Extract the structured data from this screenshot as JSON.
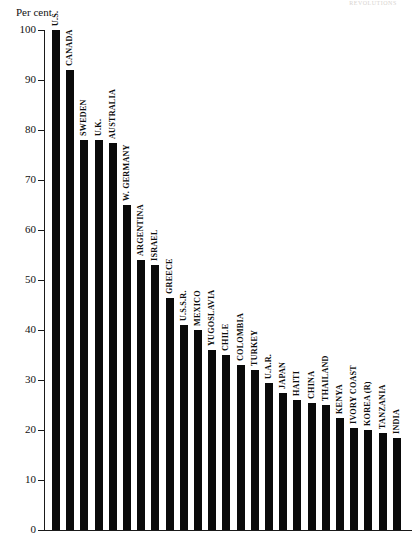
{
  "page": {
    "header_ghost": "REVOLUTIONS"
  },
  "chart_data": {
    "type": "bar",
    "title": "",
    "subtitle": "",
    "xlabel": "",
    "ylabel": "Per cent",
    "ylim": [
      0,
      100
    ],
    "ytick_step": 10,
    "yticks": [
      100,
      90,
      80,
      70,
      60,
      50,
      40,
      30,
      20,
      10,
      0
    ],
    "grid": false,
    "legend": "none",
    "orientation": "vertical",
    "bar_color": "#0a0a0a",
    "label_rotation": -90,
    "categories": [
      "U.S.",
      "CANADA",
      "SWEDEN",
      "U.K.",
      "AUSTRALIA",
      "W. GERMANY",
      "ARGENTINA",
      "ISRAEL",
      "GREECE",
      "U.S.S.R.",
      "MEXICO",
      "YUGOSLAVIA",
      "CHILE",
      "COLOMBIA",
      "TURKEY",
      "U.A.R.",
      "JAPAN",
      "HAITI",
      "CHINA",
      "THAILAND",
      "KENYA",
      "IVORY COAST",
      "KOREA (R)",
      "TANZANIA",
      "INDIA"
    ],
    "values": [
      100,
      92,
      78,
      78,
      77.5,
      65,
      54,
      53,
      46.5,
      41,
      40,
      36,
      35,
      33,
      32,
      29.5,
      27.5,
      26,
      25.5,
      25,
      22.5,
      20.5,
      20,
      19.5,
      18.5
    ]
  }
}
